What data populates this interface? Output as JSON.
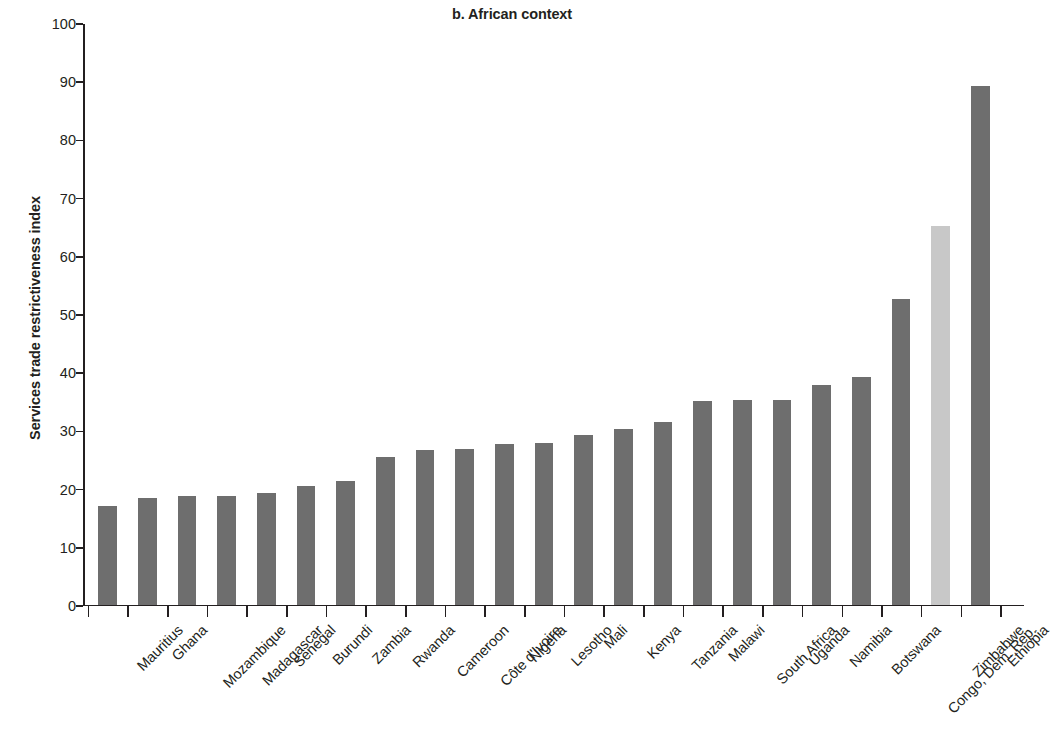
{
  "chart_data": {
    "type": "bar",
    "title": "b. African context",
    "xlabel": "",
    "ylabel": "Services trade restrictiveness index",
    "ylim": [
      0,
      100
    ],
    "y_ticks": [
      0,
      10,
      20,
      30,
      40,
      50,
      60,
      70,
      80,
      90,
      100
    ],
    "grid": false,
    "legend": null,
    "categories": [
      "Mauritius",
      "Ghana",
      "Mozambique",
      "Madagascar",
      "Senegal",
      "Burundi",
      "Zambia",
      "Rwanda",
      "Cameroon",
      "Côte d'Ivoire",
      "Nigeria",
      "Lesotho",
      "Mali",
      "Kenya",
      "Tanzania",
      "Malawi",
      "South Africa",
      "Uganda",
      "Namibia",
      "Botswana",
      "Congo, Dem. Rep.",
      "Zimbabwe",
      "Ethiopia"
    ],
    "values": [
      16.9,
      18.3,
      18.6,
      18.7,
      19.1,
      20.4,
      21.2,
      25.3,
      26.6,
      26.8,
      27.5,
      27.8,
      29.1,
      30.1,
      31.3,
      34.9,
      35.1,
      35.2,
      37.7,
      39.1,
      52.5,
      65.0,
      89.1
    ],
    "bar_colors": [
      "#6e6e6e",
      "#6e6e6e",
      "#6e6e6e",
      "#6e6e6e",
      "#6e6e6e",
      "#6e6e6e",
      "#6e6e6e",
      "#6e6e6e",
      "#6e6e6e",
      "#6e6e6e",
      "#6e6e6e",
      "#6e6e6e",
      "#6e6e6e",
      "#6e6e6e",
      "#6e6e6e",
      "#6e6e6e",
      "#6e6e6e",
      "#6e6e6e",
      "#6e6e6e",
      "#6e6e6e",
      "#6e6e6e",
      "#c8c8c8",
      "#6e6e6e"
    ],
    "highlight_category": "Zimbabwe",
    "colors": {
      "bar_default": "#6e6e6e",
      "bar_highlight": "#c8c8c8",
      "axis": "#231f20",
      "text": "#231f20",
      "background": "#ffffff"
    }
  }
}
